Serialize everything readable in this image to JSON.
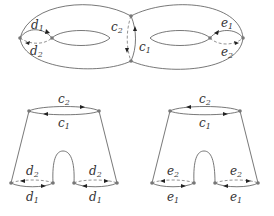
{
  "diagram": {
    "type": "genus-2 surface and pants decomposition",
    "torus": {
      "labels": {
        "d1": {
          "base": "d",
          "sub": "1"
        },
        "d2": {
          "base": "d",
          "sub": "2"
        },
        "c1": {
          "base": "c",
          "sub": "1"
        },
        "c2": {
          "base": "c",
          "sub": "2"
        },
        "e1": {
          "base": "e",
          "sub": "1"
        },
        "e2": {
          "base": "e",
          "sub": "2"
        }
      }
    },
    "pants_left": {
      "top": [
        {
          "base": "c",
          "sub": "2"
        },
        {
          "base": "c",
          "sub": "1"
        }
      ],
      "left_leg": [
        {
          "base": "d",
          "sub": "2"
        },
        {
          "base": "d",
          "sub": "1"
        }
      ],
      "right_leg": [
        {
          "base": "d",
          "sub": "2"
        },
        {
          "base": "d",
          "sub": "1"
        }
      ]
    },
    "pants_right": {
      "top": [
        {
          "base": "c",
          "sub": "2"
        },
        {
          "base": "c",
          "sub": "1"
        }
      ],
      "left_leg": [
        {
          "base": "e",
          "sub": "2"
        },
        {
          "base": "e",
          "sub": "1"
        }
      ],
      "right_leg": [
        {
          "base": "e",
          "sub": "2"
        },
        {
          "base": "e",
          "sub": "1"
        }
      ]
    }
  }
}
